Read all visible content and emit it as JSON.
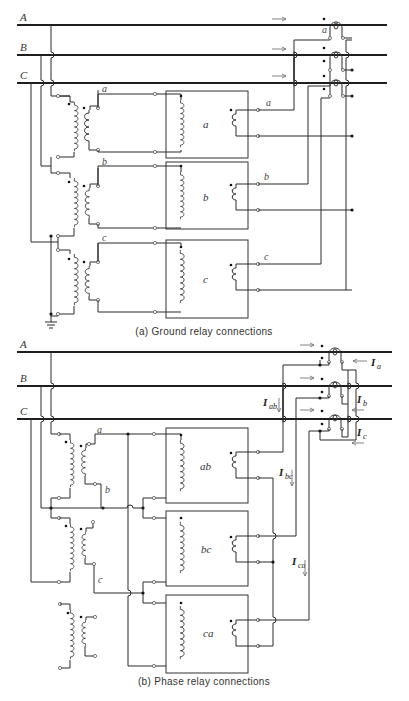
{
  "figure_a": {
    "caption": "(a) Ground relay connections",
    "bus_labels": [
      "A",
      "B",
      "C"
    ],
    "ct_labels": [
      "a"
    ],
    "line_labels": [
      "a",
      "b",
      "c"
    ],
    "relay_labels": [
      "a",
      "b",
      "c"
    ],
    "grounded": true
  },
  "figure_b": {
    "caption": "(b) Phase relay connections",
    "bus_labels": [
      "A",
      "B",
      "C"
    ],
    "line_labels": [
      "a",
      "b",
      "c"
    ],
    "relay_labels": [
      "ab",
      "bc",
      "ca"
    ],
    "currents": {
      "Ia": {
        "main": "I",
        "sub": "a"
      },
      "Ib": {
        "main": "I",
        "sub": "b"
      },
      "Ic": {
        "main": "I",
        "sub": "c"
      },
      "Iab": {
        "main": "I",
        "sub": "ab"
      },
      "Ibc": {
        "main": "I",
        "sub": "bc"
      },
      "Ica": {
        "main": "I",
        "sub": "ca"
      }
    }
  }
}
